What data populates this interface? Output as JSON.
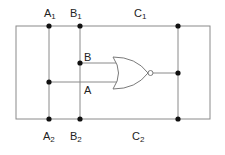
{
  "diagram": {
    "type": "logic-circuit",
    "gate": "NOR",
    "labels": {
      "a1": {
        "main": "A",
        "sub": "1"
      },
      "b1": {
        "main": "B",
        "sub": "1"
      },
      "c1": {
        "main": "C",
        "sub": "1"
      },
      "a2": {
        "main": "A",
        "sub": "2"
      },
      "b2": {
        "main": "B",
        "sub": "2"
      },
      "c2": {
        "main": "C",
        "sub": "2"
      },
      "input_b": "B",
      "input_a": "A"
    },
    "colors": {
      "wire": "#8a8a8a",
      "node": "#111111",
      "text": "#222222"
    }
  }
}
